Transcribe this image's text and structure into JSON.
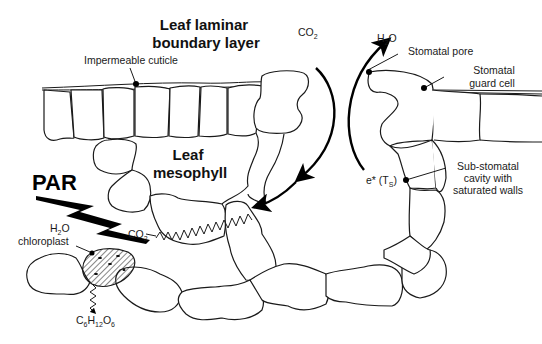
{
  "diagram": {
    "type": "leaf cross-section",
    "labels": {
      "boundary_layer_line1": "Leaf laminar",
      "boundary_layer_line2": "boundary layer",
      "cuticle": "Impermeable cuticle",
      "mesophyll_line1": "Leaf",
      "mesophyll_line2": "mesophyll",
      "co2_top": "CO",
      "co2_top_sub": "2",
      "h2o_top": "H",
      "h2o_top_sub": "2",
      "h2o_top_end": "O",
      "stomatal_pore": "Stomatal pore",
      "guard_cell_line1": "Stomatal",
      "guard_cell_line2": "guard cell",
      "substomatal_line1": "Sub-stomatal",
      "substomatal_line2": "cavity with",
      "substomatal_line3": "saturated walls",
      "e_star": "e* (T",
      "e_star_sub": "S",
      "e_star_end": ")",
      "par": "PAR",
      "h2o_left": "H",
      "h2o_left_sub": "2",
      "h2o_left_end": "O",
      "co2_left": "CO",
      "co2_left_sub": "2",
      "chloroplast": "chloroplast",
      "glucose_c": "C",
      "glucose_6a": "6",
      "glucose_h": "H",
      "glucose_12": "12",
      "glucose_o": "O",
      "glucose_6b": "6"
    },
    "colors": {
      "line": "#1a1a1a",
      "background": "#ffffff",
      "bolt": "#000000"
    }
  }
}
